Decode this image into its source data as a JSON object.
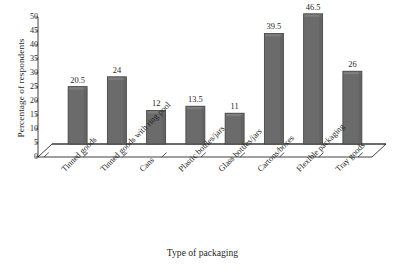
{
  "chart_data": {
    "type": "bar",
    "title": "",
    "subtitle": "",
    "xlabel": "Type of packaging",
    "ylabel": "Percentage of respondents",
    "categories": [
      "Tinned goods",
      "Tinned goods with ring pool",
      "Cans",
      "Plastic bottles/jars",
      "Glass bottles/jars",
      "Cartons/boxes",
      "Flexible packaging",
      "Tray goods"
    ],
    "values": [
      20.5,
      24,
      12,
      13.5,
      11,
      39.5,
      46.5,
      26
    ],
    "value_labels": [
      "20.5",
      "24",
      "12",
      "13.5",
      "11",
      "39.5",
      "46.5",
      "26"
    ],
    "ylim": [
      0,
      50
    ],
    "ytick_values": [
      0,
      5,
      10,
      15,
      20,
      25,
      30,
      35,
      40,
      45,
      50
    ],
    "ytick_labels": [
      "0",
      "5",
      "10",
      "15",
      "20",
      "25",
      "30",
      "35",
      "40",
      "45",
      "50"
    ],
    "grid": false,
    "legend": null,
    "legend_position": "none",
    "style": "3d-perspective",
    "bar_color": "#6b6b6b",
    "bar_edge_color": "#3f3f3f",
    "bar_top_color": "#7e7e7e",
    "axis_color": "#2b2b2b",
    "floor_color": "#ffffff",
    "background_color": "#ffffff"
  }
}
